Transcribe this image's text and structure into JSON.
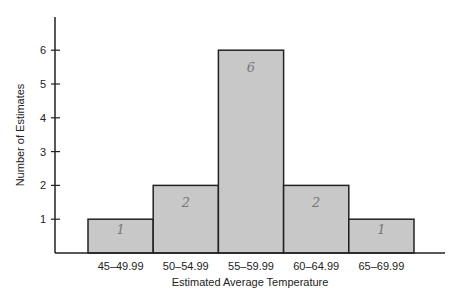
{
  "chart_data": {
    "type": "bar",
    "title": "",
    "xlabel": "Estimated Average Temperature",
    "ylabel": "Number of Estimates",
    "categories": [
      "45–49.99",
      "50–54.99",
      "55–59.99",
      "60–64.99",
      "65–69.99"
    ],
    "values": [
      1,
      2,
      6,
      2,
      1
    ],
    "handwritten_labels": [
      "1",
      "2",
      "6",
      "2",
      "1"
    ],
    "yticks": [
      1,
      2,
      3,
      4,
      5,
      6
    ],
    "ylim": [
      0,
      7
    ],
    "grid": false,
    "legend": null,
    "bar_color": "#c8c8c8",
    "edge_color": "#222222"
  }
}
